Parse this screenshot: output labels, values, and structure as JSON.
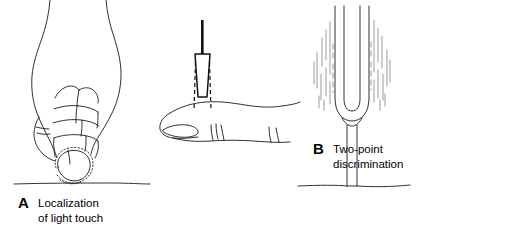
{
  "figure": {
    "background_color": "#ffffff",
    "ink_color": "#000000",
    "vibration_mark_color": "#8a8a8a"
  },
  "panels": [
    {
      "id": "A",
      "letter": "A",
      "caption_line1": "Localization",
      "caption_line2": "of light touch",
      "illustration": "hand-touching-cotton-wisp",
      "elements": [
        "hand-outline",
        "finger-creases",
        "thumb",
        "cotton-wisp",
        "surface-line"
      ]
    },
    {
      "id": "B",
      "letter": "B",
      "caption_line1": "Two-point",
      "caption_line2": "discrimination",
      "illustration": "caliper-on-fingertip",
      "elements": [
        "caliper-shaft",
        "caliper-body",
        "caliper-points-dashed",
        "finger-outline",
        "fingernail",
        "knuckle-creases"
      ]
    },
    {
      "id": "C",
      "letter": "C",
      "caption_line1": "Vibration",
      "caption_line2": "sense",
      "illustration": "tuning-fork-vibrating",
      "elements": [
        "tuning-fork-tines",
        "tuning-fork-handle",
        "vibration-lines-left",
        "vibration-lines-right",
        "surface-line"
      ]
    }
  ]
}
